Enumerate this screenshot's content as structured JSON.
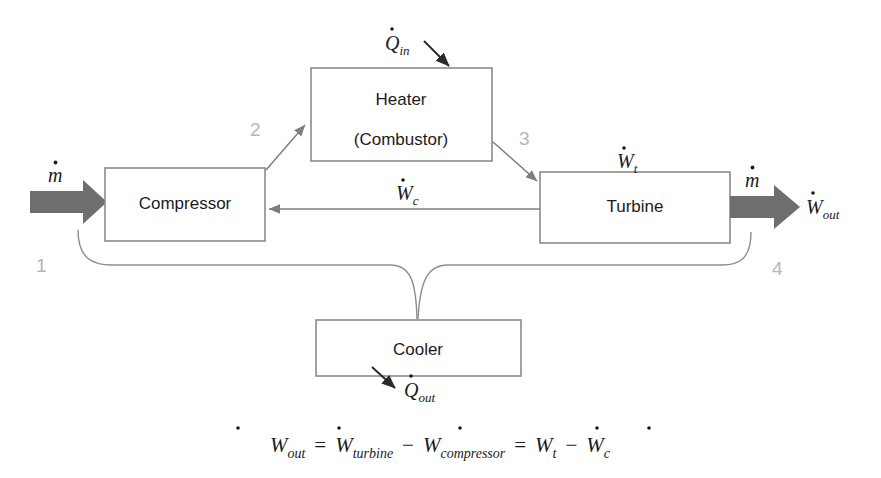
{
  "diagram": {
    "units": [
      {
        "id": "compressor",
        "label": "Compressor"
      },
      {
        "id": "heater",
        "label": "Heater",
        "label2": "(Combustor)"
      },
      {
        "id": "turbine",
        "label": "Turbine"
      },
      {
        "id": "cooler",
        "label": "Cooler"
      }
    ],
    "state_points": [
      {
        "id": "state-1",
        "label": "1"
      },
      {
        "id": "state-2",
        "label": "2"
      },
      {
        "id": "state-3",
        "label": "3"
      },
      {
        "id": "state-4",
        "label": "4"
      }
    ],
    "flow_labels": {
      "mdot_in_base": "m",
      "mdot_in_sub": "",
      "mdot_out_base": "m",
      "mdot_out_sub": "",
      "w_out_base": "W",
      "w_out_sub": "out",
      "q_in_base": "Q",
      "q_in_sub": "in",
      "q_out_base": "Q",
      "q_out_sub": "out",
      "w_t_base": "W",
      "w_t_sub": "t",
      "w_c_base": "W",
      "w_c_sub": "c"
    },
    "equation": {
      "lhs_base": "W",
      "lhs_sub": "out",
      "eq1": "=",
      "t1_base": "W",
      "t1_sub": "turbine",
      "minus1": "−",
      "t2_base": "W",
      "t2_sub": "compressor",
      "eq2": "=",
      "t3_base": "W",
      "t3_sub": "t",
      "minus2": "−",
      "t4_base": "W",
      "t4_sub": "c",
      "full_text": "W_out = W_turbine - W_compressor = W_t - W_c"
    },
    "colors": {
      "background": "#ffffff",
      "box_stroke": "#8a8a8a",
      "line_stroke": "#7e7e7e",
      "loop_stroke": "#8d8d8d",
      "thick_flow_fill": "#6e6e6e",
      "state_number": "#b6b6b6",
      "text": "#1b1b1b",
      "dark_arrow": "#2b2b2b"
    }
  }
}
